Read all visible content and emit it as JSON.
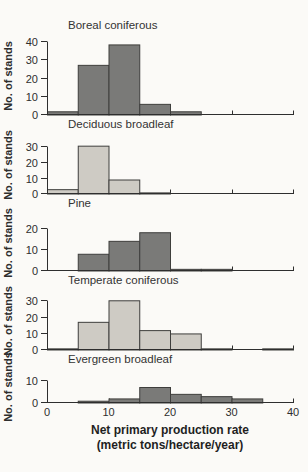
{
  "figure": {
    "background": "#fbfaf7",
    "axis_color": "#2e2e2e",
    "text_color": "#2e2e2e",
    "bar_stroke": "#3e3e3c",
    "bar_fills": {
      "dark": "#7a7a78",
      "light": "#cecbc4"
    }
  },
  "xaxis": {
    "title_line1": "Net primary production rate",
    "title_line2": "(metric tons/hectare/year)",
    "ticks": [
      0,
      10,
      20,
      30,
      40
    ],
    "range": [
      0,
      40
    ]
  },
  "chart_data": [
    {
      "type": "bar",
      "title": "Boreal coniferous",
      "ylabel": "No. of stands",
      "bin_edges": [
        0,
        5,
        10,
        15,
        20,
        25,
        30,
        35,
        40
      ],
      "values": [
        2,
        27,
        38,
        6,
        2,
        0,
        0,
        0
      ],
      "yticks": [
        0,
        10,
        20,
        30,
        40
      ],
      "ylim": [
        0,
        42
      ],
      "bar_style": "dark"
    },
    {
      "type": "bar",
      "title": "Deciduous broadleaf",
      "ylabel": "No. of stands",
      "bin_edges": [
        0,
        5,
        10,
        15,
        20,
        25,
        30,
        35,
        40
      ],
      "values": [
        3,
        30,
        9,
        1,
        0,
        0,
        0,
        0
      ],
      "yticks": [
        0,
        10,
        20,
        30
      ],
      "ylim": [
        0,
        36
      ],
      "bar_style": "light"
    },
    {
      "type": "bar",
      "title": "Pine",
      "ylabel": "No. of stands",
      "bin_edges": [
        0,
        5,
        10,
        15,
        20,
        25,
        30,
        35,
        40
      ],
      "values": [
        0,
        8,
        14,
        18,
        1,
        1,
        0,
        0
      ],
      "yticks": [
        0,
        10,
        20
      ],
      "ylim": [
        0,
        26
      ],
      "bar_style": "dark"
    },
    {
      "type": "bar",
      "title": "Temperate coniferous",
      "ylabel": "No. of stands",
      "bin_edges": [
        0,
        5,
        10,
        15,
        20,
        25,
        30,
        35,
        40
      ],
      "values": [
        1,
        17,
        30,
        12,
        10,
        1,
        0,
        1
      ],
      "yticks": [
        0,
        10,
        20,
        30
      ],
      "ylim": [
        0,
        35
      ],
      "bar_style": "light"
    },
    {
      "type": "bar",
      "title": "Evergreen broadleaf",
      "ylabel": "No. of stands",
      "bin_edges": [
        0,
        5,
        10,
        15,
        20,
        25,
        30,
        35,
        40
      ],
      "values": [
        0,
        1,
        2,
        7,
        4,
        3,
        2,
        0
      ],
      "yticks": [
        0,
        10
      ],
      "ylim": [
        0,
        14
      ],
      "bar_style": "dark"
    }
  ]
}
